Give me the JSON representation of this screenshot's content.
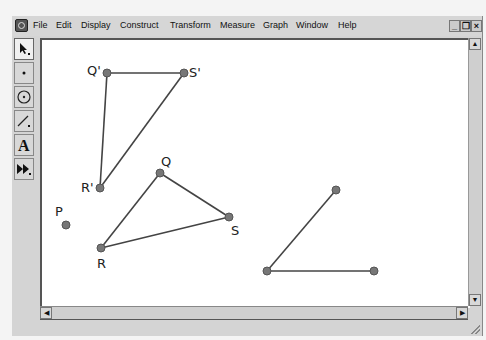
{
  "menubar": {
    "items": [
      "File",
      "Edit",
      "Display",
      "Construct",
      "Transform",
      "Measure",
      "Graph",
      "Window",
      "Help"
    ],
    "window_buttons": {
      "minimize": "_",
      "restore": "❐",
      "close": "×"
    }
  },
  "toolbar": {
    "tools": [
      {
        "name": "selection-arrow-tool",
        "glyph": "↖"
      },
      {
        "name": "point-tool",
        "glyph": "•"
      },
      {
        "name": "compass-tool",
        "glyph": "⊙"
      },
      {
        "name": "straightedge-tool",
        "glyph": "/"
      },
      {
        "name": "text-tool",
        "glyph": "A"
      },
      {
        "name": "custom-tool",
        "glyph": "▶▶"
      }
    ]
  },
  "scrollbars": {
    "up": "▲",
    "down": "▼",
    "left": "◀",
    "right": "▶"
  },
  "sketch": {
    "colors": {
      "point": "#777777",
      "point_stroke": "#555555",
      "segment": "#444444"
    },
    "points": [
      {
        "id": "Q'",
        "label": "Q'",
        "x": 107,
        "y": 73,
        "lx": 87,
        "ly": 75
      },
      {
        "id": "S'",
        "label": "S'",
        "x": 184,
        "y": 73,
        "lx": 189,
        "ly": 77
      },
      {
        "id": "R'",
        "label": "R'",
        "x": 100,
        "y": 188,
        "lx": 81,
        "ly": 192
      },
      {
        "id": "Q",
        "label": "Q",
        "x": 160,
        "y": 173,
        "lx": 161,
        "ly": 166
      },
      {
        "id": "S",
        "label": "S",
        "x": 229,
        "y": 217,
        "lx": 231,
        "ly": 235
      },
      {
        "id": "R",
        "label": "R",
        "x": 101,
        "y": 248,
        "lx": 97,
        "ly": 268
      },
      {
        "id": "P",
        "label": "P",
        "x": 66,
        "y": 225,
        "lx": 55,
        "ly": 216
      },
      {
        "id": "A",
        "label": "",
        "x": 267,
        "y": 271
      },
      {
        "id": "B",
        "label": "",
        "x": 336,
        "y": 190
      },
      {
        "id": "C",
        "label": "",
        "x": 374,
        "y": 271
      }
    ],
    "segments": [
      [
        "Q'",
        "S'"
      ],
      [
        "Q'",
        "R'"
      ],
      [
        "R'",
        "S'"
      ],
      [
        "Q",
        "S"
      ],
      [
        "Q",
        "R"
      ],
      [
        "R",
        "S"
      ],
      [
        "A",
        "B"
      ],
      [
        "A",
        "C"
      ]
    ]
  }
}
